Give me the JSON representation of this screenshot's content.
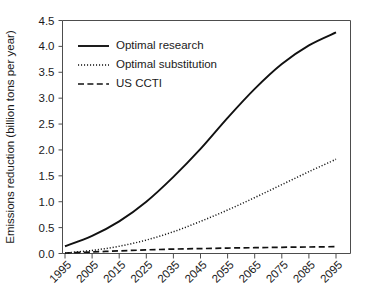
{
  "chart_data": {
    "type": "line",
    "title": "",
    "xlabel": "",
    "ylabel": "Emissions reduction (billion tons per year)",
    "xlim": [
      1995,
      2095
    ],
    "ylim": [
      0.0,
      4.5
    ],
    "grid": false,
    "legend_position": "top-left",
    "x": [
      1995,
      2005,
      2015,
      2025,
      2035,
      2045,
      2055,
      2065,
      2075,
      2085,
      2095
    ],
    "xtick_labels": [
      "1995",
      "2005",
      "2015",
      "2025",
      "2035",
      "2045",
      "2055",
      "2065",
      "2075",
      "2085",
      "2095"
    ],
    "ytick_labels": [
      "0.0",
      "0.5",
      "1.0",
      "1.5",
      "2.0",
      "2.5",
      "3.0",
      "3.5",
      "4.0",
      "4.5"
    ],
    "ytick_values": [
      0.0,
      0.5,
      1.0,
      1.5,
      2.0,
      2.5,
      3.0,
      3.5,
      4.0,
      4.5
    ],
    "series": [
      {
        "name": "Optimal research",
        "style": "solid",
        "color": "#111111",
        "values": [
          0.14,
          0.34,
          0.62,
          1.0,
          1.48,
          2.02,
          2.62,
          3.18,
          3.66,
          4.02,
          4.27
        ]
      },
      {
        "name": "Optimal substitution",
        "style": "dotted",
        "color": "#111111",
        "values": [
          0.01,
          0.06,
          0.14,
          0.26,
          0.42,
          0.62,
          0.84,
          1.08,
          1.33,
          1.58,
          1.82
        ]
      },
      {
        "name": "US CCTI",
        "style": "dashed",
        "color": "#111111",
        "values": [
          0.01,
          0.03,
          0.05,
          0.07,
          0.085,
          0.095,
          0.105,
          0.112,
          0.12,
          0.126,
          0.132
        ]
      }
    ]
  },
  "legend": {
    "items": [
      {
        "label": "Optimal research"
      },
      {
        "label": "Optimal substitution"
      },
      {
        "label": "US CCTI"
      }
    ]
  },
  "axes": {
    "y_title": "Emissions reduction (billion tons per year)"
  }
}
